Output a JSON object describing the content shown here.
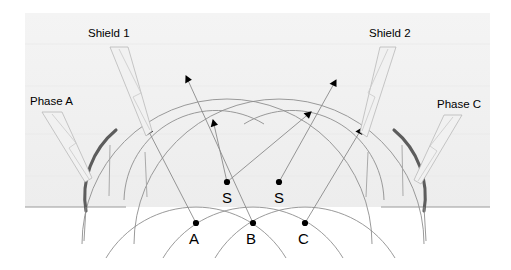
{
  "diagram": {
    "type": "electrical-protection-zone-diagram",
    "canvas": {
      "width": 511,
      "height": 270
    },
    "colors": {
      "background": "#ffffff",
      "panel": "#f2f2f2",
      "arc_thin": "#8a8a8a",
      "arc_thick": "#5e5e5e",
      "ground_line": "#9a9a9a",
      "leader_fill": "#f0f0f0",
      "leader_stroke": "#b8b8b8",
      "marker": "#000000",
      "text": "#000000"
    },
    "callouts": [
      {
        "id": "shield-1",
        "label": "Shield 1",
        "x": 88,
        "y": 28
      },
      {
        "id": "shield-2",
        "label": "Shield 2",
        "x": 369,
        "y": 28
      },
      {
        "id": "phase-a",
        "label": "Phase A",
        "x": 30,
        "y": 96
      },
      {
        "id": "phase-c",
        "label": "Phase C",
        "x": 437,
        "y": 99
      }
    ],
    "conductors": [
      {
        "id": "shield-wire-1",
        "label": "S",
        "dot_x": 227,
        "dot_y": 182,
        "label_x": 222,
        "label_y": 190
      },
      {
        "id": "shield-wire-2",
        "label": "S",
        "dot_x": 279,
        "dot_y": 182,
        "label_x": 274,
        "label_y": 190
      },
      {
        "id": "phase-conductor-a",
        "label": "A",
        "dot_x": 196,
        "dot_y": 223,
        "label_x": 189,
        "label_y": 231
      },
      {
        "id": "phase-conductor-b",
        "label": "B",
        "dot_x": 253,
        "dot_y": 223,
        "label_x": 246,
        "label_y": 231
      },
      {
        "id": "phase-conductor-c",
        "label": "C",
        "dot_x": 305,
        "dot_y": 223,
        "label_x": 298,
        "label_y": 231
      }
    ],
    "ground_lines": [
      {
        "id": "ground-left",
        "x1": 25,
        "y1": 207,
        "x2": 126,
        "y2": 207
      },
      {
        "id": "ground-right",
        "x1": 381,
        "y1": 207,
        "x2": 490,
        "y2": 207
      }
    ],
    "panel": {
      "x": 25,
      "y": 13,
      "width": 465,
      "height": 194
    },
    "arrow_count": 6,
    "arc_count": 6
  }
}
